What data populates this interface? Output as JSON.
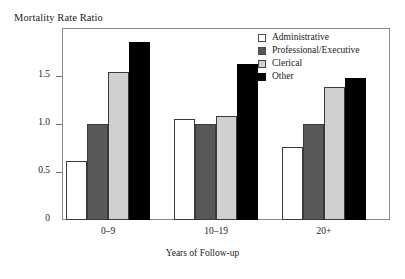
{
  "chart_data": {
    "type": "bar",
    "title": "Mortality Rate Ratio",
    "xlabel": "Years of Follow-up",
    "ylabel": "Mortality Rate Ratio",
    "categories": [
      "0–9",
      "10–19",
      "20+"
    ],
    "series": [
      {
        "name": "Administrative",
        "values": [
          0.61,
          1.05,
          0.76
        ],
        "color": "#ffffff"
      },
      {
        "name": "Professional/Executive",
        "values": [
          1.0,
          1.0,
          1.0
        ],
        "color": "#58585a"
      },
      {
        "name": "Clerical",
        "values": [
          1.54,
          1.08,
          1.39
        ],
        "color": "#d0d0cf"
      },
      {
        "name": "Other",
        "values": [
          1.85,
          1.63,
          1.48
        ],
        "color": "#000000"
      }
    ],
    "ylim": [
      0,
      2.0
    ],
    "yticks": [
      0,
      0.5,
      1.0,
      1.5
    ],
    "ytick_labels": [
      "0",
      "0.5",
      "1.0",
      "1.5"
    ],
    "grid": false,
    "legend_position": "top-right",
    "axis_color": "#8a8a8a"
  }
}
